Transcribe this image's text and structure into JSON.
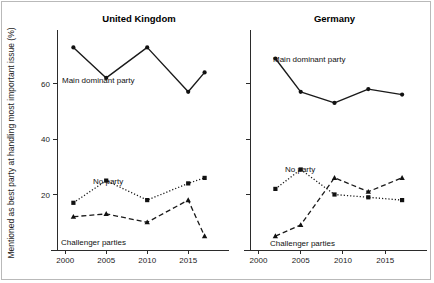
{
  "figure": {
    "ylabel": "Mentioned as best party at handling most important issue (%)",
    "panels": [
      {
        "title": "United Kingdom",
        "xticks": [
          "2000",
          "2005",
          "2010",
          "2015"
        ],
        "annotations": [
          {
            "text": "Main dominant party"
          },
          {
            "text": "No party"
          },
          {
            "text": "Challenger parties"
          }
        ]
      },
      {
        "title": "Germany",
        "xticks": [
          "2000",
          "2005",
          "2010",
          "2015"
        ],
        "annotations": [
          {
            "text": "Main dominant party"
          },
          {
            "text": "No party"
          },
          {
            "text": "Challenger parties"
          }
        ]
      }
    ],
    "yticks": [
      "20",
      "40",
      "60"
    ]
  },
  "chart_data": [
    {
      "type": "line",
      "title": "United Kingdom",
      "xlabel": "",
      "ylabel": "Mentioned as best party at handling most important issue (%)",
      "xlim": [
        1999,
        2019
      ],
      "ylim": [
        0,
        80
      ],
      "xticks": [
        2000,
        2005,
        2010,
        2015
      ],
      "yticks": [
        20,
        40,
        60
      ],
      "grid": false,
      "legend": "inline-annotations",
      "series": [
        {
          "name": "Main dominant party",
          "style": "solid",
          "marker": "circle",
          "x": [
            2001,
            2005,
            2010,
            2015,
            2017
          ],
          "values": [
            73,
            62,
            73,
            57,
            64
          ]
        },
        {
          "name": "No party",
          "style": "dotted",
          "marker": "square",
          "x": [
            2001,
            2005,
            2010,
            2015,
            2017
          ],
          "values": [
            17,
            25,
            18,
            24,
            26
          ]
        },
        {
          "name": "Challenger parties",
          "style": "dashed",
          "marker": "triangle",
          "x": [
            2001,
            2005,
            2010,
            2015,
            2017
          ],
          "values": [
            12,
            13,
            10,
            18,
            5
          ]
        }
      ]
    },
    {
      "type": "line",
      "title": "Germany",
      "xlabel": "",
      "ylabel": "Mentioned as best party at handling most important issue (%)",
      "xlim": [
        1999,
        2019
      ],
      "ylim": [
        0,
        80
      ],
      "xticks": [
        2000,
        2005,
        2010,
        2015
      ],
      "yticks": [
        20,
        40,
        60
      ],
      "grid": false,
      "legend": "inline-annotations",
      "series": [
        {
          "name": "Main dominant party",
          "style": "solid",
          "marker": "circle",
          "x": [
            2002,
            2005,
            2009,
            2013,
            2017
          ],
          "values": [
            69,
            57,
            53,
            58,
            56
          ]
        },
        {
          "name": "No party",
          "style": "dotted",
          "marker": "square",
          "x": [
            2002,
            2005,
            2009,
            2013,
            2017
          ],
          "values": [
            22,
            29,
            20,
            19,
            18
          ]
        },
        {
          "name": "Challenger parties",
          "style": "dashed",
          "marker": "triangle",
          "x": [
            2002,
            2005,
            2009,
            2013,
            2017
          ],
          "values": [
            5,
            9,
            26,
            21,
            26
          ]
        }
      ]
    }
  ]
}
